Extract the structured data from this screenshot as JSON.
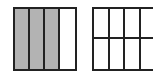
{
  "figures": [
    {
      "name": "left-square",
      "columns": 4,
      "rows": 1,
      "shaded_count": 3,
      "shade_color": "#b3b3b3"
    },
    {
      "name": "right-square",
      "columns": 4,
      "rows": 2,
      "shaded_count": 0,
      "shade_color": "#b3b3b3"
    }
  ],
  "line_color": "#222222"
}
